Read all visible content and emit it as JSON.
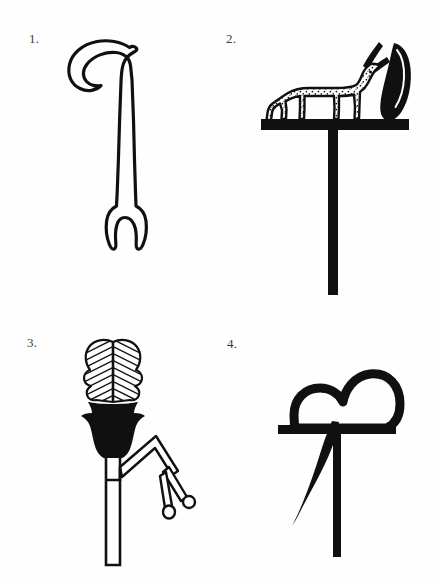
{
  "plate": {
    "background_color": "#fefefe",
    "ink_color": "#101010",
    "width": 442,
    "height": 583,
    "caption": ""
  },
  "figures": [
    {
      "number": "1.",
      "name": "hooked-crook-staff",
      "description": "Outlined hooked crook staff with long shaft ending in a two-pronged fork",
      "style": "line-outline",
      "fill": "none",
      "stroke": "#101010"
    },
    {
      "number": "2.",
      "name": "gazelle-standard",
      "description": "Standard with spotted horned gazelle on a crossbar, tall feather plume behind, vertical pole below",
      "style": "solid-silhouette-with-stipple",
      "fill": "#101010",
      "stroke": "#101010"
    },
    {
      "number": "3.",
      "name": "papyrus-fan-standard",
      "description": "Hatched heart-shaped feather fan in a solid black calyx on an outlined stem with a branching arm ending in two bud knobs",
      "style": "hatched-and-solid",
      "fill": "#101010",
      "stroke": "#101010"
    },
    {
      "number": "4.",
      "name": "double-lobed-emblem-standard",
      "description": "Thick outlined double-lobed cloud/heart emblem resting on a crossbar with pole and a wavy streamer hanging at the left",
      "style": "thick-outline",
      "fill": "none",
      "stroke": "#101010"
    }
  ]
}
